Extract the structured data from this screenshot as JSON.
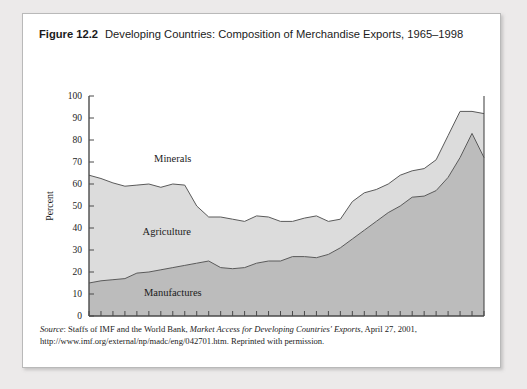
{
  "figure": {
    "number": "Figure 12.2",
    "caption": "Developing Countries: Composition of Merchandise Exports, 1965–1998"
  },
  "source": {
    "label": "Source",
    "text_before_title": ": Staffs of IMF and the World Bank, ",
    "italic_title": "Market Access for Developing Countries' Exports",
    "text_after_title": ", April 27, 2001, http://www.imf.org/external/np/madc/eng/042701.htm. Reprinted with permission."
  },
  "colors": {
    "minerals": "#ffffff",
    "agriculture": "#dcdcdc",
    "manufactures": "#bcbcbc",
    "line": "#5a5a5a",
    "axis": "#4a4a4a",
    "card_background": "#ffffff",
    "page_background": "#eceaea"
  },
  "chart_data": {
    "type": "area",
    "title": "Developing Countries: Composition of Merchandise Exports, 1965–1998",
    "xlabel": "",
    "ylabel": "Percent",
    "xlim": [
      1965,
      1998
    ],
    "ylim": [
      0,
      100
    ],
    "grid": false,
    "stacked": true,
    "legend_position": "inline-labels",
    "x_tick_labels": [
      "1965",
      "1970",
      "1975",
      "1980",
      "1985",
      "1990",
      "1995",
      "1998"
    ],
    "x_tick_values": [
      1965,
      1970,
      1975,
      1980,
      1985,
      1990,
      1995,
      1998
    ],
    "x_minor_ticks_every": 1,
    "y_tick_labels": [
      "0",
      "10",
      "20",
      "30",
      "40",
      "50",
      "60",
      "70",
      "80",
      "90",
      "100"
    ],
    "y_tick_values": [
      0,
      10,
      20,
      30,
      40,
      50,
      60,
      70,
      80,
      90,
      100
    ],
    "x": [
      1965,
      1966,
      1967,
      1968,
      1969,
      1970,
      1971,
      1972,
      1973,
      1974,
      1975,
      1976,
      1977,
      1978,
      1979,
      1980,
      1981,
      1982,
      1983,
      1984,
      1985,
      1986,
      1987,
      1988,
      1989,
      1990,
      1991,
      1992,
      1993,
      1994,
      1995,
      1996,
      1997,
      1998
    ],
    "series": [
      {
        "name": "Manufactures",
        "label_x": 1972,
        "label_y": 9,
        "color": "#bcbcbc",
        "values": [
          15,
          16,
          16.5,
          17,
          19.5,
          20,
          21,
          22,
          23,
          24,
          25,
          22,
          21.5,
          22,
          24,
          25,
          25,
          27,
          27,
          26.5,
          28,
          31,
          35,
          39,
          43,
          47,
          50,
          54,
          54.5,
          57,
          63,
          72,
          83,
          72
        ]
      },
      {
        "name": "Agriculture",
        "label_x": 1971.5,
        "label_y": 37,
        "color": "#dcdcdc",
        "values": [
          49,
          46.5,
          44,
          42,
          40,
          40,
          37.5,
          38,
          36.5,
          26,
          20,
          23,
          22.5,
          21,
          21.5,
          20,
          18,
          16,
          17.5,
          19,
          15,
          13,
          17,
          17,
          14.5,
          13,
          14,
          12,
          12.5,
          14,
          19,
          21,
          10,
          20
        ]
      },
      {
        "name": "Minerals",
        "label_x": 1972,
        "label_y": 70,
        "color": "#ffffff",
        "values": [
          36,
          37.5,
          39.5,
          41,
          40.5,
          40,
          41.5,
          40,
          40.5,
          50,
          55,
          55,
          56,
          57,
          54.5,
          55,
          57,
          57,
          55.5,
          54.5,
          57,
          56,
          48,
          44,
          42.5,
          40,
          36,
          34,
          33,
          29,
          18,
          7,
          7,
          8
        ]
      }
    ],
    "cumulative_lower_boundary": [
      15,
      16,
      16.5,
      17,
      19.5,
      20,
      21,
      22,
      23,
      24,
      25,
      22,
      21.5,
      22,
      24,
      25,
      25,
      27,
      27,
      26.5,
      28,
      31,
      35,
      39,
      43,
      47,
      50,
      54,
      54.5,
      57,
      63,
      72,
      83,
      72
    ],
    "cumulative_upper_boundary": [
      64,
      62.5,
      60.5,
      59,
      59.5,
      60,
      58.5,
      60,
      59.5,
      50,
      45,
      45,
      44,
      43,
      45.5,
      45,
      43,
      43,
      44.5,
      45.5,
      43,
      44,
      52,
      56,
      57.5,
      60,
      64,
      66,
      67,
      71,
      82,
      93,
      93,
      92
    ]
  }
}
